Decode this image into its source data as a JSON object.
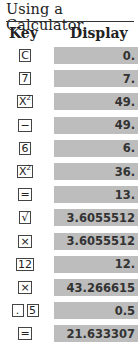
{
  "title": "Using a Calculator",
  "headers": {
    "key": "Key",
    "display": "Display"
  },
  "rows": [
    {
      "keys": [
        "C"
      ],
      "display": "0."
    },
    {
      "keys": [
        "7"
      ],
      "display": "7."
    },
    {
      "keys": [
        "X²"
      ],
      "display": "49."
    },
    {
      "keys": [
        "−"
      ],
      "display": "49."
    },
    {
      "keys": [
        "6"
      ],
      "display": "6."
    },
    {
      "keys": [
        "X²"
      ],
      "display": "36."
    },
    {
      "keys": [
        "="
      ],
      "display": "13."
    },
    {
      "keys": [
        "√"
      ],
      "display": "3.6055512"
    },
    {
      "keys": [
        "×"
      ],
      "display": "3.6055512"
    },
    {
      "keys": [
        "12"
      ],
      "display": "12."
    },
    {
      "keys": [
        "×"
      ],
      "display": "43.266615"
    },
    {
      "keys": [
        ".",
        "5"
      ],
      "display": "0.5"
    },
    {
      "keys": [
        "="
      ],
      "display": "21.633307"
    }
  ],
  "colors": {
    "display_bg": "#bdbdbd",
    "text": "#222222"
  }
}
